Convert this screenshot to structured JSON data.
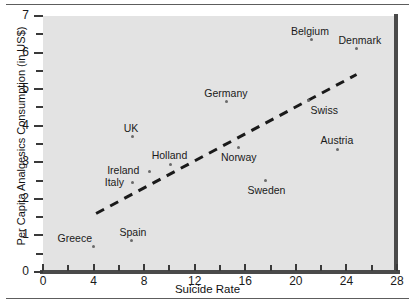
{
  "chart_data": {
    "type": "scatter",
    "title": "",
    "xlabel": "Suicide Rate",
    "ylabel": "Per Capita Analgesics Consumption (in US$)",
    "xlim": [
      0,
      28
    ],
    "ylim": [
      0,
      7
    ],
    "x_ticks": [
      "0",
      "4",
      "8",
      "12",
      "16",
      "20",
      "24",
      "28"
    ],
    "x_tick_values": [
      0,
      4,
      8,
      12,
      16,
      20,
      24,
      28
    ],
    "x_minor_step": 2,
    "y_ticks": [
      "0",
      "1",
      "2",
      "3",
      "4",
      "5",
      "6",
      "7"
    ],
    "y_tick_values": [
      0,
      1,
      2,
      3,
      4,
      5,
      6,
      7
    ],
    "y_minor_step": 0.5,
    "grid": false,
    "legend": "none",
    "points": [
      {
        "label": "Greece",
        "x": 4.0,
        "y": 0.7,
        "label_dx": -36,
        "label_dy": -13
      },
      {
        "label": "Spain",
        "x": 7.0,
        "y": 0.85,
        "label_dx": -12,
        "label_dy": -14
      },
      {
        "label": "Italy",
        "x": 7.1,
        "y": 2.45,
        "label_dx": -28,
        "label_dy": -5
      },
      {
        "label": "UK",
        "x": 7.1,
        "y": 3.7,
        "label_dx": -9,
        "label_dy": -14
      },
      {
        "label": "Ireland",
        "x": 8.4,
        "y": 2.75,
        "label_dx": -42,
        "label_dy": -6
      },
      {
        "label": "Holland",
        "x": 10.1,
        "y": 2.95,
        "label_dx": -19,
        "label_dy": -14
      },
      {
        "label": "Germany",
        "x": 14.5,
        "y": 4.65,
        "label_dx": -22,
        "label_dy": -14
      },
      {
        "label": "Norway",
        "x": 15.5,
        "y": 3.4,
        "label_dx": -18,
        "label_dy": 4
      },
      {
        "label": "Sweden",
        "x": 17.6,
        "y": 2.5,
        "label_dx": -18,
        "label_dy": 4
      },
      {
        "label": "Swiss",
        "x": 21.0,
        "y": 4.7,
        "label_dx": 2,
        "label_dy": 5
      },
      {
        "label": "Belgium",
        "x": 21.2,
        "y": 6.35,
        "label_dx": -20,
        "label_dy": -14
      },
      {
        "label": "Austria",
        "x": 23.3,
        "y": 3.35,
        "label_dx": -17,
        "label_dy": -14
      },
      {
        "label": "Denmark",
        "x": 24.8,
        "y": 6.1,
        "label_dx": -18,
        "label_dy": -14
      }
    ],
    "trendline": {
      "style": "dashed",
      "x1": 4.2,
      "y1": 1.6,
      "x2": 24.8,
      "y2": 5.4
    }
  }
}
